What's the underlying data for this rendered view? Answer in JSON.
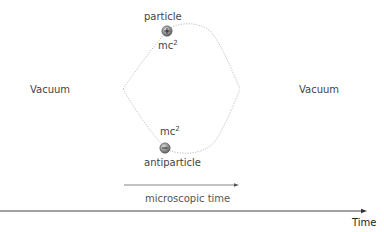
{
  "diagram": {
    "type": "vacuum-fluctuation",
    "left_label": "Vacuum",
    "right_label": "Vacuum",
    "particle": {
      "label": "particle",
      "symbol": "+",
      "energy_base": "mc",
      "energy_exp": "2"
    },
    "antiparticle": {
      "label": "antiparticle",
      "symbol": "−",
      "energy_base": "mc",
      "energy_exp": "2"
    },
    "short_arrow_label": "microscopic time",
    "axis_label": "Time",
    "colors": {
      "text": "#444444",
      "curve": "#b8b8b8",
      "arrow": "#555555",
      "particle_fill": "#8a8a8a",
      "particle_edge": "#5a5a5a"
    }
  }
}
